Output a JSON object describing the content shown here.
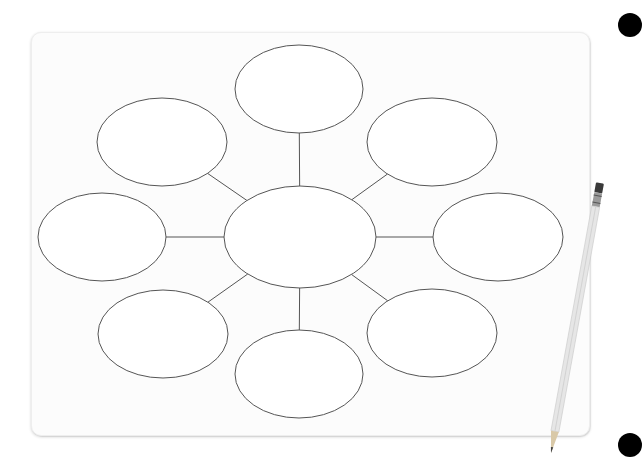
{
  "diagram": {
    "type": "bubble-map",
    "stroke_color": "#555555",
    "board_color": "#fcfcfc",
    "center": {
      "cx": 300,
      "cy": 237,
      "rx": 76,
      "ry": 51,
      "label": ""
    },
    "nodes": [
      {
        "id": "top",
        "cx": 299,
        "cy": 89,
        "rx": 64,
        "ry": 44,
        "label": ""
      },
      {
        "id": "top-right",
        "cx": 432,
        "cy": 142,
        "rx": 65,
        "ry": 44,
        "label": ""
      },
      {
        "id": "right",
        "cx": 498,
        "cy": 237,
        "rx": 65,
        "ry": 44,
        "label": ""
      },
      {
        "id": "bottom-right",
        "cx": 432,
        "cy": 333,
        "rx": 65,
        "ry": 44,
        "label": ""
      },
      {
        "id": "bottom",
        "cx": 299,
        "cy": 374,
        "rx": 64,
        "ry": 44,
        "label": ""
      },
      {
        "id": "bottom-left",
        "cx": 163,
        "cy": 334,
        "rx": 65,
        "ry": 44,
        "label": ""
      },
      {
        "id": "left",
        "cx": 102,
        "cy": 237,
        "rx": 64,
        "ry": 44,
        "label": ""
      },
      {
        "id": "top-left",
        "cx": 162,
        "cy": 142,
        "rx": 65,
        "ry": 44,
        "label": ""
      }
    ]
  },
  "decorations": {
    "pencil": {
      "x1": 600,
      "y1": 183,
      "x2": 551,
      "y2": 453
    },
    "dots": [
      {
        "cx": 630,
        "cy": 25
      },
      {
        "cx": 630,
        "cy": 445
      }
    ]
  }
}
